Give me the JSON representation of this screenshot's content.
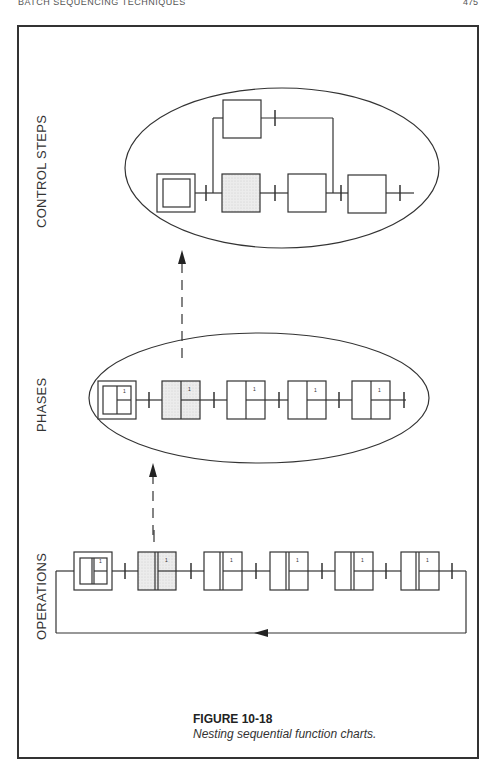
{
  "page": {
    "running_head": "BATCH SEQUENCING TECHNIQUES",
    "page_number": "475"
  },
  "levels": {
    "control_steps": {
      "label": "CONTROL STEPS"
    },
    "phases": {
      "label": "PHASES"
    },
    "operations": {
      "label": "OPERATIONS"
    }
  },
  "diagram": {
    "control_steps": {
      "steps": [
        {
          "type": "initial",
          "shaded": false
        },
        {
          "type": "step",
          "shaded": true
        },
        {
          "type": "step",
          "shaded": false
        },
        {
          "type": "step",
          "shaded": false
        }
      ],
      "parallel_branch_step": {
        "type": "step",
        "shaded": false
      }
    },
    "phases": {
      "steps": [
        {
          "type": "initial-macro",
          "shaded": false,
          "marker": "1"
        },
        {
          "type": "macro",
          "shaded": true,
          "marker": "1"
        },
        {
          "type": "macro",
          "shaded": false,
          "marker": "1"
        },
        {
          "type": "macro",
          "shaded": false,
          "marker": "1"
        },
        {
          "type": "macro",
          "shaded": false,
          "marker": "1"
        }
      ]
    },
    "operations": {
      "steps": [
        {
          "type": "initial-macro",
          "shaded": false,
          "marker": "1"
        },
        {
          "type": "macro",
          "shaded": true,
          "marker": "1"
        },
        {
          "type": "macro",
          "shaded": false,
          "marker": "1"
        },
        {
          "type": "macro",
          "shaded": false,
          "marker": "1"
        },
        {
          "type": "macro",
          "shaded": false,
          "marker": "1"
        },
        {
          "type": "macro",
          "shaded": false,
          "marker": "1"
        }
      ],
      "loop_back": true
    },
    "colors": {
      "line": "#333333",
      "shade": "#e6e6e6",
      "background": "#ffffff"
    }
  },
  "caption": {
    "title": "FIGURE 10-18",
    "text": "Nesting sequential function charts."
  }
}
